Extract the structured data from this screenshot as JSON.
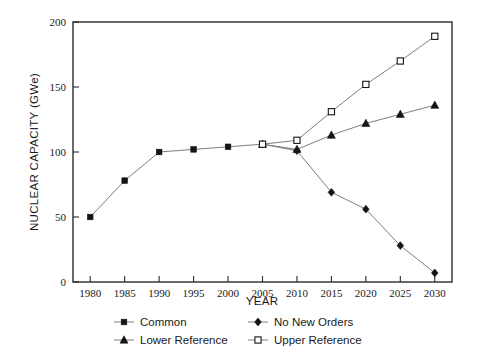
{
  "chart_data": {
    "type": "line",
    "title": "",
    "xlabel": "YEAR",
    "ylabel": "NUCLEAR CAPACITY (GWe)",
    "x": [
      1980,
      1985,
      1990,
      1995,
      2000,
      2005,
      2010,
      2015,
      2020,
      2025,
      2030
    ],
    "xlim": [
      1977.5,
      2032.5
    ],
    "ylim": [
      0,
      200
    ],
    "xticks": [
      "1980",
      "1985",
      "1990",
      "1995",
      "2000",
      "2005",
      "2010",
      "2015",
      "2020",
      "2025",
      "2030"
    ],
    "yticks": [
      "0",
      "50",
      "100",
      "150",
      "200"
    ],
    "grid": false,
    "legend_position": "bottom",
    "series": [
      {
        "name": "Common",
        "marker": "filled-square",
        "x": [
          1980,
          1985,
          1990,
          1995,
          2000,
          2005
        ],
        "values": [
          50,
          78,
          100,
          102,
          104,
          106
        ]
      },
      {
        "name": "No New Orders",
        "marker": "filled-diamond",
        "x": [
          2005,
          2010,
          2015,
          2020,
          2025,
          2030
        ],
        "values": [
          106,
          101,
          69,
          56,
          28,
          7
        ]
      },
      {
        "name": "Lower Reference",
        "marker": "filled-triangle",
        "x": [
          2005,
          2010,
          2015,
          2020,
          2025,
          2030
        ],
        "values": [
          106,
          102,
          113,
          122,
          129,
          136
        ]
      },
      {
        "name": "Upper Reference",
        "marker": "open-square",
        "x": [
          2005,
          2010,
          2015,
          2020,
          2025,
          2030
        ],
        "values": [
          106,
          109,
          131,
          152,
          170,
          189
        ]
      }
    ],
    "colors": {
      "line": "#6f6f6f",
      "marker": "#141414",
      "axis": "#2b2b2b",
      "background": "#ffffff"
    }
  },
  "legend": {
    "entries": [
      {
        "label": "Common",
        "marker": "filled-square"
      },
      {
        "label": "No New Orders",
        "marker": "filled-diamond"
      },
      {
        "label": "Lower Reference",
        "marker": "filled-triangle"
      },
      {
        "label": "Upper Reference",
        "marker": "open-square"
      }
    ]
  }
}
